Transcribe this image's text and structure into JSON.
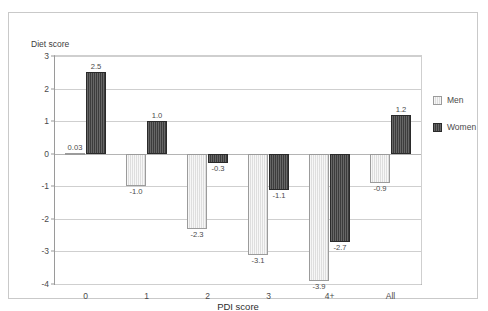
{
  "chart_data": {
    "type": "bar",
    "title": "",
    "ylabel": "Diet score",
    "xlabel": "PDI score",
    "categories": [
      "0",
      "1",
      "2",
      "3",
      "4+",
      "All"
    ],
    "series": [
      {
        "name": "Men",
        "color": "#dedede",
        "values": [
          0.03,
          -1.0,
          -2.3,
          -3.1,
          -3.9,
          -0.9
        ],
        "labels": [
          "0.03",
          "-1.0",
          "-2.3",
          "-3.1",
          "-3.9",
          "-0.9"
        ]
      },
      {
        "name": "Women",
        "color": "#3c3c3c",
        "values": [
          2.5,
          1.0,
          -0.3,
          -1.1,
          -2.7,
          1.2
        ],
        "labels": [
          "2.5",
          "1.0",
          "-0.3",
          "-1.1",
          "-2.7",
          "1.2"
        ]
      }
    ],
    "ylim": [
      -4,
      3
    ],
    "yticks": [
      3,
      2,
      1,
      0,
      -1,
      -2,
      -3,
      -4
    ],
    "ytick_labels": [
      "3",
      "2",
      "1",
      "0",
      "-1",
      "-2",
      "-3",
      "-4"
    ],
    "grid": true,
    "legend_position": "right",
    "legend_entries": [
      "Men",
      "Women"
    ]
  }
}
